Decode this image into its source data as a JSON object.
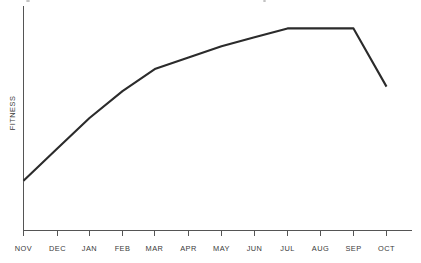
{
  "chart_data": {
    "type": "line",
    "title": "",
    "xlabel": "",
    "ylabel": "FITNESS",
    "categories": [
      "NOV",
      "DEC",
      "JAN",
      "FEB",
      "MAR",
      "APR",
      "MAY",
      "JUN",
      "JUL",
      "AUG",
      "SEP",
      "OCT"
    ],
    "series": [
      {
        "name": "Fitness",
        "values": [
          22,
          36,
          50,
          62,
          72,
          77,
          82,
          86,
          90,
          90,
          90,
          64
        ]
      }
    ],
    "ylim": [
      0,
      100
    ],
    "y_tick_labels": [],
    "grid": false,
    "legend": false,
    "legend_position": "none",
    "annotations": [
      "Steady rise from NOV to MAR",
      "Gradual gain MAR through JUL",
      "Flat plateau JUL to SEP",
      "Sharp decline SEP to OCT"
    ],
    "colors": {
      "line": "#2b2b2b",
      "axis": "#555555",
      "label": "#3a3a3a",
      "background": "#ffffff"
    }
  },
  "axes": {
    "y_title": "FITNESS",
    "x_tick_labels": [
      "NOV",
      "DEC",
      "JAN",
      "FEB",
      "MAR",
      "APR",
      "MAY",
      "JUN",
      "JUL",
      "AUG",
      "SEP",
      "OCT"
    ]
  }
}
